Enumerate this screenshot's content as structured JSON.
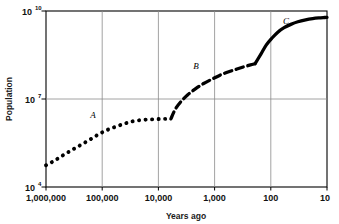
{
  "chart_data": {
    "type": "line",
    "title": "",
    "xlabel": "Years ago",
    "ylabel": "Population",
    "xscale": "log-reversed",
    "yscale": "log",
    "grid": true,
    "legend": false,
    "xticks": [
      "1,000,000",
      "100,000",
      "10,000",
      "1,000",
      "100",
      "10"
    ],
    "xtick_values": [
      1000000,
      100000,
      10000,
      1000,
      100,
      10
    ],
    "yticks": [
      "10^4",
      "10^7",
      "10^10"
    ],
    "ytick_mantissa": [
      "10",
      "10",
      "10"
    ],
    "ytick_exponent": [
      "4",
      "7",
      "10"
    ],
    "ytick_values": [
      10000,
      10000000,
      10000000000
    ],
    "xlim": [
      1000000,
      10
    ],
    "ylim": [
      10000,
      10000000000
    ],
    "series": [
      {
        "name": "A",
        "label": "A",
        "style": "dotted",
        "description": "Hunting and gathering era, slow population growth",
        "x": [
          1000000,
          700000,
          500000,
          350000,
          250000,
          170000,
          120000,
          85000,
          60000,
          42000,
          30000,
          21000,
          15000,
          11000,
          8500,
          7000,
          6000
        ],
        "y": [
          55000,
          80000,
          120000,
          180000,
          260000,
          400000,
          600000,
          850000,
          1100000,
          1400000,
          1700000,
          1900000,
          2000000,
          2050000,
          2100000,
          2100000,
          2100000
        ]
      },
      {
        "name": "B",
        "label": "B",
        "style": "dashed",
        "description": "Agricultural revolution, accelerated growth",
        "x": [
          6000,
          5000,
          4000,
          3000,
          2200,
          1600,
          1100,
          800,
          560,
          400,
          300,
          230,
          190
        ],
        "y": [
          2100000,
          4500000,
          8000000,
          14000000,
          22000000,
          33000000,
          48000000,
          65000000,
          85000000,
          105000000,
          125000000,
          145000000,
          160000000
        ]
      },
      {
        "name": "C",
        "label": "C",
        "style": "solid",
        "description": "Industrial revolution, explosive growth then leveling",
        "x": [
          190,
          150,
          120,
          95,
          75,
          58,
          44,
          33,
          24,
          18,
          14,
          11,
          10
        ],
        "y": [
          160000000,
          340000000,
          700000000,
          1200000000,
          1900000000,
          2700000000,
          3500000000,
          4300000000,
          5000000000,
          5500000000,
          5800000000,
          6000000000,
          6100000000
        ]
      }
    ],
    "annotations": [
      {
        "text": "A",
        "x_px": 93,
        "y_px": 118
      },
      {
        "text": "B",
        "x_px": 196,
        "y_px": 69
      },
      {
        "text": "C",
        "x_px": 286,
        "y_px": 24
      }
    ],
    "colors": {
      "curve": "#000000",
      "grid": "#808080",
      "axis": "#000000",
      "background": "#ffffff",
      "text": "#111111"
    }
  }
}
